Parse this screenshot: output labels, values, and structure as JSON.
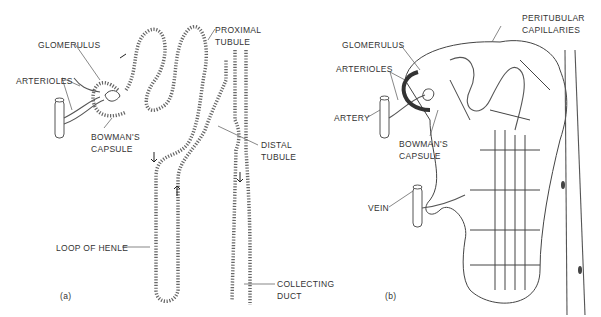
{
  "figure": {
    "panel_a": {
      "id": "(a)",
      "labels": {
        "glomerulus": "GLOMERULUS",
        "arterioles": "ARTERIOLES",
        "bowmans_capsule_1": "BOWMAN'S",
        "bowmans_capsule_2": "CAPSULE",
        "proximal_tubule_1": "PROXIMAL",
        "proximal_tubule_2": "TUBULE",
        "distal_tubule_1": "DISTAL",
        "distal_tubule_2": "TUBULE",
        "loop_of_henle": "LOOP OF HENLE",
        "collecting_duct_1": "COLLECTING",
        "collecting_duct_2": "DUCT"
      }
    },
    "panel_b": {
      "id": "(b)",
      "labels": {
        "glomerulus": "GLOMERULUS",
        "arterioles": "ARTERIOLES",
        "artery": "ARTERY",
        "bowmans_capsule_1": "BOWMAN'S",
        "bowmans_capsule_2": "CAPSULE",
        "peritubular_1": "PERITUBULAR",
        "peritubular_2": "CAPILLARIES",
        "vein": "VEIN"
      }
    }
  }
}
